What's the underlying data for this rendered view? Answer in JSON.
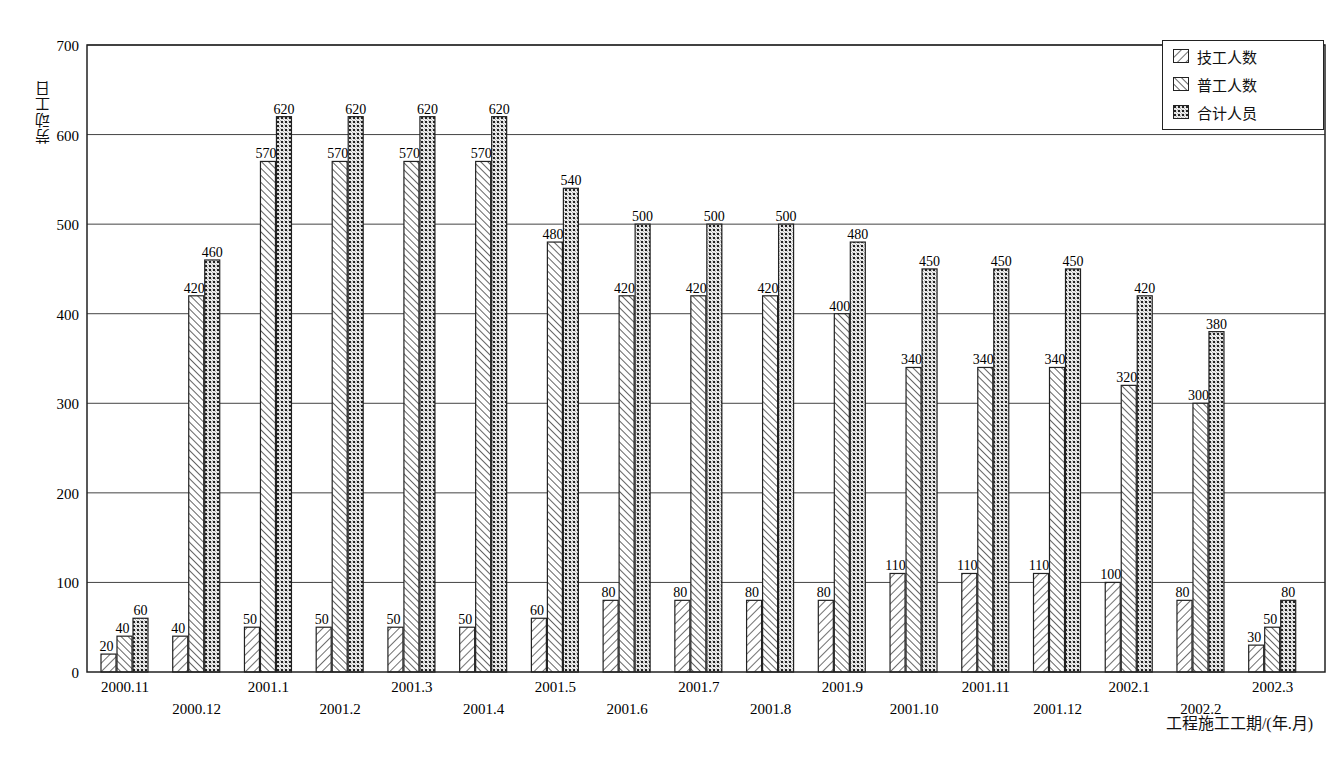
{
  "chart_data": {
    "type": "bar",
    "title": "",
    "xlabel": "工程施工工期/(年.月)",
    "ylabel": "劳动工日",
    "ylim": [
      0,
      700
    ],
    "yticks": [
      0,
      100,
      200,
      300,
      400,
      500,
      600,
      700
    ],
    "grid": true,
    "legend_position": "top-right",
    "categories": [
      "2000.11",
      "2000.12",
      "2001.1",
      "2001.2",
      "2001.3",
      "2001.4",
      "2001.5",
      "2001.6",
      "2001.7",
      "2001.8",
      "2001.9",
      "2001.10",
      "2001.11",
      "2001.12",
      "2002.1",
      "2002.2",
      "2002.3"
    ],
    "series": [
      {
        "name": "技工人数",
        "pattern": "diag-right",
        "values": [
          20,
          40,
          50,
          50,
          50,
          50,
          60,
          80,
          80,
          80,
          80,
          110,
          110,
          110,
          100,
          80,
          30
        ]
      },
      {
        "name": "普工人数",
        "pattern": "diag-left",
        "values": [
          40,
          420,
          570,
          570,
          570,
          570,
          480,
          420,
          420,
          420,
          400,
          340,
          340,
          340,
          320,
          300,
          50
        ]
      },
      {
        "name": "合计人员",
        "pattern": "crosshatch",
        "values": [
          60,
          460,
          620,
          620,
          620,
          620,
          540,
          500,
          500,
          500,
          480,
          450,
          450,
          450,
          420,
          380,
          80
        ]
      }
    ]
  },
  "legend": {
    "items": [
      "技工人数",
      "普工人数",
      "合计人员"
    ]
  },
  "axes": {
    "xlabel": "工程施工工期/(年.月)",
    "ylabel": "劳动工日"
  }
}
